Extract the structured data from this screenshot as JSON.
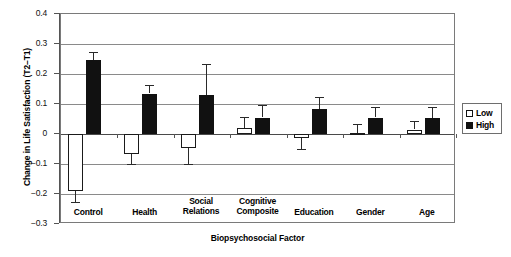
{
  "chart_data": {
    "type": "bar",
    "title": "",
    "xlabel": "Biopsychosocial Factor",
    "ylabel": "Change in Life Satisfaction (T2–T1)",
    "ylim": [
      -0.3,
      0.4
    ],
    "ytick_labels": [
      "0.4",
      "0.3",
      "0.2",
      "0.1",
      "0",
      "−0.1",
      "−0.2",
      "−0.3"
    ],
    "ytick_values": [
      0.4,
      0.3,
      0.2,
      0.1,
      0,
      -0.1,
      -0.2,
      -0.3
    ],
    "grid": true,
    "legend_position": "right",
    "categories": [
      "Control",
      "Health",
      "Social\nRelations",
      "Cognitive\nComposite",
      "Education",
      "Gender",
      "Age"
    ],
    "series": [
      {
        "name": "Low",
        "color": "#ffffff",
        "values": [
          -0.19,
          -0.068,
          -0.048,
          0.02,
          -0.012,
          0.004,
          0.015
        ],
        "errors": [
          0.035,
          0.032,
          0.053,
          0.037,
          0.038,
          0.031,
          0.029
        ]
      },
      {
        "name": "High",
        "color": "#111111",
        "values": [
          0.248,
          0.135,
          0.13,
          0.055,
          0.082,
          0.055,
          0.055
        ],
        "errors": [
          0.027,
          0.029,
          0.105,
          0.042,
          0.043,
          0.036,
          0.035
        ]
      }
    ]
  },
  "legend": {
    "items": [
      {
        "label": "Low",
        "style": "low"
      },
      {
        "label": "High",
        "style": "high"
      }
    ]
  },
  "axis_titles": {
    "x": "Biopsychosocial Factor",
    "y": "Change in Life Satisfaction (T2–T1)"
  }
}
